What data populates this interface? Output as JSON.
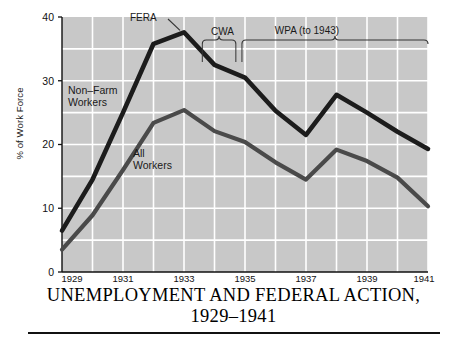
{
  "caption": {
    "line1": "UNEMPLOYMENT AND FEDERAL ACTION,",
    "line2": "1929–1941"
  },
  "axes": {
    "ylabel": "% of Work Force",
    "yticks": [
      "0",
      "10",
      "20",
      "30",
      "40"
    ],
    "xticks": [
      "1929",
      "1931",
      "1933",
      "1935",
      "1937",
      "1939",
      "1941"
    ]
  },
  "series_labels": {
    "non_farm": "Non–Farm\nWorkers",
    "all_workers": "All\nWorkers"
  },
  "annotations": {
    "fera": "FERA",
    "cwa": "CWA",
    "wpa": "WPA (to 1943)"
  },
  "colors": {
    "plot_background": "#c8c8c8",
    "gridline": "#ffffff",
    "line_non_farm": "#1c1c1c",
    "line_all_workers": "#4a4a4a",
    "axis": "#111111",
    "annotation": "#333333"
  },
  "chart_data": {
    "type": "line",
    "title": "UNEMPLOYMENT AND FEDERAL ACTION, 1929–1941",
    "xlabel": "",
    "ylabel": "% of Work Force",
    "xlim": [
      1929,
      1941
    ],
    "ylim": [
      0,
      40
    ],
    "grid": true,
    "legend": "inline-labels",
    "x": [
      1929,
      1930,
      1931,
      1932,
      1933,
      1934,
      1935,
      1936,
      1937,
      1938,
      1939,
      1940,
      1941
    ],
    "series": [
      {
        "name": "Non-Farm Workers",
        "values": [
          6.5,
          14.5,
          25.0,
          35.8,
          37.6,
          32.5,
          30.5,
          25.3,
          21.5,
          27.8,
          25.0,
          22.0,
          19.3
        ]
      },
      {
        "name": "All Workers",
        "values": [
          3.5,
          8.9,
          16.0,
          23.4,
          25.4,
          22.1,
          20.4,
          17.2,
          14.5,
          19.2,
          17.4,
          14.8,
          10.3
        ]
      }
    ],
    "annotations": [
      {
        "label": "FERA",
        "type": "leader-line",
        "x_from": 1933.0,
        "x_to": 1933.0,
        "note": "points to 1933 peak of Non-Farm Workers"
      },
      {
        "label": "CWA",
        "type": "bracket",
        "x_start": 1933.6,
        "x_end": 1934.7
      },
      {
        "label": "WPA (to 1943)",
        "type": "bracket",
        "x_start": 1934.9,
        "x_end": 1941.0
      }
    ]
  }
}
